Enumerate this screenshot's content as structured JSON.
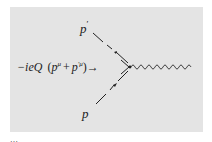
{
  "figure": {
    "background": "#e4e4e4",
    "line_color": "#222222",
    "vertex_label": {
      "prefix": "−ieQ",
      "open": "(",
      "p1": "p",
      "p1_sup": "μ",
      "plus": "+",
      "p2": "p",
      "p2_sup": "′μ",
      "close": ")",
      "arrow": "→"
    },
    "incoming_label": "p",
    "outgoing_label": "p",
    "outgoing_prime": "′",
    "boson_line": "photon",
    "caption_fragment": "…"
  }
}
